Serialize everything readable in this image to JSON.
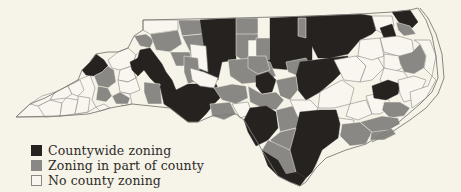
{
  "map": {
    "subject": "North Carolina counties by zoning coverage",
    "colors": {
      "countywide": "#252220",
      "partial": "#8a8884",
      "none": "#f8f6ee",
      "background": "#f6f3e8"
    }
  },
  "legend": {
    "items": [
      {
        "key": "countywide",
        "label": "Countywide zoning",
        "color": "#252220"
      },
      {
        "key": "partial",
        "label": "Zoning in part of county",
        "color": "#8a8884"
      },
      {
        "key": "none",
        "label": "No county zoning",
        "color": "#f8f6ee"
      }
    ]
  }
}
